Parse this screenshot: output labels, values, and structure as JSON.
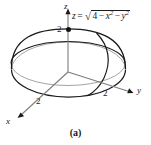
{
  "figure": {
    "caption": "(a)",
    "equation": {
      "lhs": "z",
      "equals": "=",
      "radical_symbol": "√",
      "radicand_parts": [
        "4",
        "−",
        "x",
        "2",
        "−",
        "y",
        "2"
      ],
      "plain_text": "z = √(4 − x² − y²)"
    },
    "axes": {
      "z_label": "z",
      "y_label": "y",
      "x_label": "x"
    },
    "ticks": {
      "z_tick": "2",
      "y_tick": "2",
      "x_tick": "2"
    },
    "colors": {
      "ink": "#1a1a1a",
      "hidden_line": "#8a8a8a",
      "background": "#ffffff"
    },
    "shape": {
      "name": "hemisphere",
      "radius": 2,
      "description": "upper half of sphere of radius 2 centered at origin"
    }
  }
}
